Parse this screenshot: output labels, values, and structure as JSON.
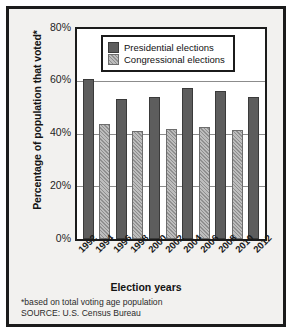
{
  "chart_data": {
    "type": "bar",
    "title": "",
    "xlabel": "Election years",
    "ylabel": "Percentage of population that voted*",
    "ylim": [
      0,
      80
    ],
    "grid": true,
    "legend_position": "top-left inside plot",
    "categories": [
      "1992",
      "1994",
      "1996",
      "1998",
      "2000",
      "2002",
      "2004",
      "2006",
      "2008",
      "2010",
      "2012"
    ],
    "bar_types": [
      "Presidential",
      "Congressional",
      "Presidential",
      "Congressional",
      "Presidential",
      "Congressional",
      "Presidential",
      "Congressional",
      "Presidential",
      "Congressional",
      "Presidential"
    ],
    "values": [
      61,
      44,
      53.5,
      41,
      54,
      42,
      57.5,
      42.5,
      56.5,
      41.5,
      54
    ],
    "series": [
      {
        "name": "Presidential elections",
        "color": "#5d5d5d",
        "points": [
          {
            "year": "1992",
            "value": 61
          },
          {
            "year": "1996",
            "value": 53.5
          },
          {
            "year": "2000",
            "value": 54
          },
          {
            "year": "2004",
            "value": 57.5
          },
          {
            "year": "2008",
            "value": 56.5
          },
          {
            "year": "2012",
            "value": 54
          }
        ]
      },
      {
        "name": "Congressional elections",
        "color": "#a0a0a0",
        "points": [
          {
            "year": "1994",
            "value": 44
          },
          {
            "year": "1998",
            "value": 41
          },
          {
            "year": "2002",
            "value": 42
          },
          {
            "year": "2006",
            "value": 42.5
          },
          {
            "year": "2010",
            "value": 41.5
          }
        ]
      }
    ],
    "yticks": [
      "0%",
      "20%",
      "40%",
      "60%",
      "80%"
    ],
    "ytick_values": [
      0,
      20,
      40,
      60,
      80
    ]
  },
  "legend": {
    "items": [
      {
        "label": "Presidential elections",
        "swatch": "presidential"
      },
      {
        "label": "Congressional elections",
        "swatch": "congressional"
      }
    ]
  },
  "axes": {
    "y_title": "Percentage of population that voted*",
    "x_title": "Election years",
    "y_ticks": [
      "80%",
      "60%",
      "40%",
      "20%",
      "0%"
    ],
    "x_ticks": [
      "1992",
      "1994",
      "1996",
      "1998",
      "2000",
      "2002",
      "2004",
      "2006",
      "2008",
      "2010",
      "2012"
    ]
  },
  "notes": {
    "footnote": "*based on total voting age population",
    "source": "SOURCE: U.S. Census Bureau"
  },
  "colors": {
    "presidential": "#5d5d5d",
    "congressional": "#a0a0a0",
    "frame": "#1b1b1b",
    "background": "#f2f1ef",
    "gridline": "#8c8c8c"
  }
}
